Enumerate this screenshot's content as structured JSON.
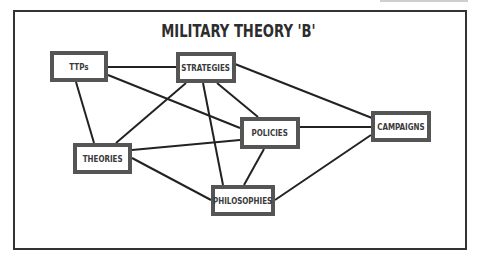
{
  "diagram": {
    "title": "MILITARY THEORY 'B'",
    "nodes": {
      "ttps": {
        "label": "TTPs"
      },
      "strategies": {
        "label": "STRATEGIES"
      },
      "policies": {
        "label": "POLICIES"
      },
      "campaigns": {
        "label": "CAMPAIGNS"
      },
      "theories": {
        "label": "THEORIES"
      },
      "philosophies": {
        "label": "PHILOSOPHIES"
      }
    },
    "edges": [
      [
        "TTPs",
        "STRATEGIES"
      ],
      [
        "TTPs",
        "THEORIES"
      ],
      [
        "TTPs",
        "POLICIES"
      ],
      [
        "STRATEGIES",
        "THEORIES"
      ],
      [
        "STRATEGIES",
        "PHILOSOPHIES"
      ],
      [
        "STRATEGIES",
        "POLICIES"
      ],
      [
        "STRATEGIES",
        "CAMPAIGNS"
      ],
      [
        "THEORIES",
        "POLICIES"
      ],
      [
        "THEORIES",
        "PHILOSOPHIES"
      ],
      [
        "POLICIES",
        "PHILOSOPHIES"
      ],
      [
        "POLICIES",
        "CAMPAIGNS"
      ],
      [
        "PHILOSOPHIES",
        "CAMPAIGNS"
      ]
    ],
    "colors": {
      "line": "#222222",
      "node_border": "#555555",
      "frame_border": "#333333",
      "text": "#3a3a3a"
    }
  }
}
